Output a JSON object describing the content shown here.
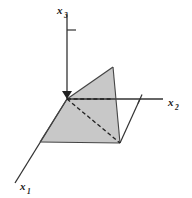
{
  "figure": {
    "background_color": "#ffffff",
    "line_color": "#333333",
    "shade_color": "#c8c8c8",
    "shade_opacity": 0.95
  },
  "axes": [
    {
      "id": "x1",
      "name": "x1-axis",
      "label_base": "x",
      "label_subscript": "1",
      "label_x": 20,
      "label_y": 190,
      "from": [
        67,
        99
      ],
      "to": [
        15,
        183
      ],
      "style": "solid",
      "tick": null
    },
    {
      "id": "x2",
      "name": "x2-axis",
      "label_base": "x",
      "label_subscript": "2",
      "label_x": 168,
      "label_y": 106,
      "from": [
        67,
        99
      ],
      "to": [
        163,
        99
      ],
      "style": "solid",
      "tick": {
        "position": [
          140,
          99
        ],
        "length": 9
      }
    },
    {
      "id": "x3",
      "name": "x3-axis",
      "label_base": "x",
      "label_subscript": "3",
      "label_x": 57,
      "label_y": 14,
      "from": [
        67,
        99
      ],
      "to": [
        67,
        14
      ],
      "style": "solid",
      "tick": {
        "position": [
          67,
          30
        ],
        "length": 9
      }
    }
  ],
  "origin": {
    "x": 67,
    "y": 99
  },
  "shaded_region": {
    "name": "shaded-plane-region",
    "points": "40,142 67,99 113,67 120,143",
    "fill": "#c8c8c8"
  },
  "dashed_lines": [
    {
      "name": "dashed-horizontal-hidden-edge",
      "from": [
        67,
        99
      ],
      "to": [
        113,
        99
      ]
    },
    {
      "name": "dashed-diagonal-hidden-edge",
      "from": [
        67,
        99
      ],
      "to": [
        120,
        143
      ]
    }
  ],
  "solid_lines": [
    {
      "name": "region-edge-origin-to-left-vertex",
      "from": [
        67,
        99
      ],
      "to": [
        40,
        142
      ]
    },
    {
      "name": "region-edge-left-bottom",
      "from": [
        40,
        142
      ],
      "to": [
        120,
        143
      ]
    },
    {
      "name": "region-edge-apex-right",
      "from": [
        113,
        67
      ],
      "to": [
        120,
        143
      ]
    },
    {
      "name": "region-edge-origin-to-apex",
      "from": [
        67,
        99
      ],
      "to": [
        113,
        67
      ]
    },
    {
      "name": "projection-line-to-x2-tick",
      "from": [
        120,
        143
      ],
      "to": [
        140,
        99
      ]
    }
  ],
  "arrow_head": {
    "name": "origin-arrowhead",
    "points": "67,99 62,91 72,91"
  }
}
